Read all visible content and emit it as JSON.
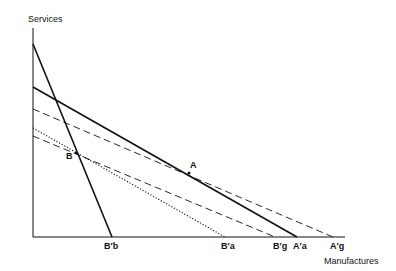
{
  "axes": {
    "y_label": "Services",
    "x_label": "Manufactures"
  },
  "points": {
    "A": "A",
    "B": "B"
  },
  "x_intercepts": {
    "B_b": "B′b",
    "B_a": "B′a",
    "B_g": "B′g",
    "A_a": "A′a",
    "A_g": "A′g"
  },
  "lines": [
    {
      "id": "steep-solid",
      "style": "solid",
      "from": [
        33,
        44
      ],
      "to": [
        112,
        237
      ]
    },
    {
      "id": "A-solid",
      "style": "solid",
      "from": [
        33,
        87
      ],
      "to": [
        297,
        237
      ]
    },
    {
      "id": "A-dashed",
      "style": "dashed",
      "from": [
        33,
        109
      ],
      "to": [
        333,
        237
      ]
    },
    {
      "id": "B-dotted",
      "style": "dotted",
      "from": [
        33,
        128
      ],
      "to": [
        225,
        237
      ]
    },
    {
      "id": "B-dashed",
      "style": "dashed",
      "from": [
        33,
        136
      ],
      "to": [
        275,
        237
      ]
    }
  ],
  "colors": {
    "ink": "#111111",
    "background": "#ffffff"
  }
}
